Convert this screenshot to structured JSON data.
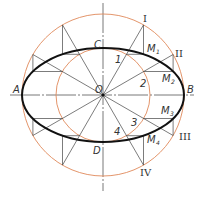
{
  "colors": {
    "circle": "#e0895a",
    "ellipse": "#111111",
    "line": "#444444",
    "axis": "#555555",
    "text": "#333333"
  },
  "geometry": {
    "center": [
      103,
      95
    ],
    "major_radius": 81,
    "minor_radius": 47
  },
  "labels": {
    "center": "O",
    "left_end": "A",
    "right_end": "B",
    "top_end": "C",
    "bottom_end": "D",
    "inner_points": [
      "1",
      "2",
      "3",
      "4"
    ],
    "outer_points": [
      "I",
      "II",
      "III",
      "IV"
    ],
    "ellipse_points": [
      {
        "m": "M",
        "sub": "1"
      },
      {
        "m": "M",
        "sub": "2"
      },
      {
        "m": "M",
        "sub": "3"
      },
      {
        "m": "M",
        "sub": "4"
      }
    ]
  }
}
